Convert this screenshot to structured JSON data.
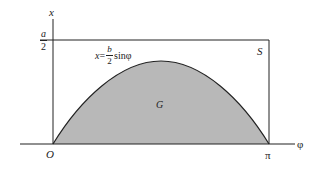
{
  "diagram": {
    "axes": {
      "vertical_label": "x",
      "horizontal_label": "φ",
      "origin_label": "O",
      "pi_label": "π",
      "top_value": {
        "numerator": "a",
        "denominator": "2"
      }
    },
    "rectangle_label": "S",
    "region_label": "G",
    "curve_equation": {
      "lhs": "x",
      "equals": "=",
      "numerator": "b",
      "denominator": "2",
      "func": "sinφ"
    },
    "colors": {
      "line": "#222222",
      "fill": "#b8b8b8",
      "background": "#ffffff"
    }
  }
}
